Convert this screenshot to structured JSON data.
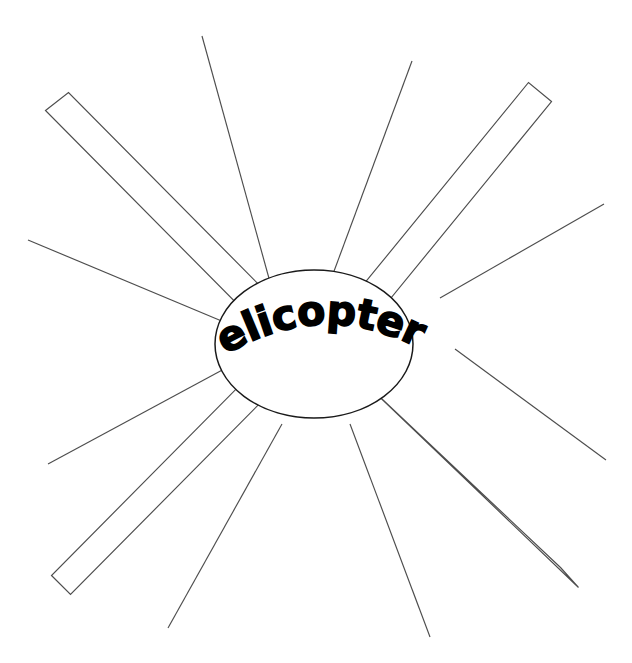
{
  "document": {
    "type": "word-web-graphic-organizer",
    "background_color": "#ffffff",
    "width": 632,
    "height": 663
  },
  "center": {
    "label": "Helicopters",
    "shape": "ellipse",
    "text_style": "arched-bold",
    "fill_color": "#ffffff",
    "stroke_color": "#1a1a1a",
    "cx": 314,
    "cy": 344,
    "rx": 99,
    "ry": 74
  },
  "spokes": {
    "count": 12,
    "stroke_color": "#4d4d4d",
    "bars": [
      {
        "name": "spoke-bar-top-left",
        "shape": "rectangle",
        "points": "45.5,110.5 68.5,92.5 285.5,311.5 262.5,329.5"
      },
      {
        "name": "spoke-bar-top-right",
        "shape": "rectangle",
        "points": "551.5,101.5 528.5,82.5 345.5,306.5 368.5,325.5"
      },
      {
        "name": "spoke-bar-bottom-left",
        "shape": "rectangle",
        "points": "51.5,575.5 70.5,594.5 279.5,383.5 259.5,365.5"
      },
      {
        "name": "spoke-bar-bottom-right",
        "shape": "rectangle",
        "points": "560.5,567.5 578.5,587.5 364.5,382.5 345.5,364.5"
      }
    ],
    "lines": [
      {
        "name": "spoke-line-top-left-steep",
        "x1": 202,
        "y1": 36,
        "x2": 270,
        "y2": 282
      },
      {
        "name": "spoke-line-top-right-steep",
        "x1": 412,
        "y1": 61,
        "x2": 330,
        "y2": 282
      },
      {
        "name": "spoke-line-left-upper",
        "x1": 28,
        "y1": 240,
        "x2": 224,
        "y2": 322
      },
      {
        "name": "spoke-line-right-upper",
        "x1": 604,
        "y1": 204,
        "x2": 440,
        "y2": 298
      },
      {
        "name": "spoke-line-left-lower",
        "x1": 48,
        "y1": 464,
        "x2": 226,
        "y2": 368
      },
      {
        "name": "spoke-line-right-lower",
        "x1": 606,
        "y1": 460,
        "x2": 455,
        "y2": 349
      },
      {
        "name": "spoke-line-bottom-left-steep",
        "x1": 168,
        "y1": 628,
        "x2": 282,
        "y2": 424
      },
      {
        "name": "spoke-line-bottom-right-steep",
        "x1": 430,
        "y1": 637,
        "x2": 350,
        "y2": 424
      }
    ]
  }
}
